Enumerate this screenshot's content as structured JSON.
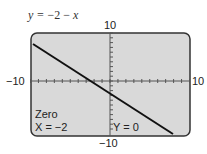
{
  "equation": {
    "prefix": "y = ",
    "rest": "−2 − ",
    "var": "x"
  },
  "window": {
    "xmin_label": "−10",
    "xmax_label": "10",
    "ymin_label": "−10",
    "ymax_label": "10"
  },
  "trace": {
    "mode": "Zero",
    "x_readout": "X = −2",
    "y_readout": "Y = 0"
  },
  "colors": {
    "screen_bg": "#d9d9d9",
    "border": "#333333",
    "line": "#111111"
  },
  "chart_data": {
    "type": "line",
    "title": "y = −2 − x",
    "x": [
      -10,
      -2,
      0,
      8
    ],
    "series": [
      {
        "name": "y = -2 - x",
        "values": [
          8,
          0,
          -2,
          -10
        ]
      }
    ],
    "xlabel": "",
    "ylabel": "",
    "xlim": [
      -10,
      10
    ],
    "ylim": [
      -10,
      10
    ],
    "xscale": 1,
    "yscale": 1,
    "grid": false,
    "annotations": [
      "Zero",
      "X = -2",
      "Y = 0"
    ]
  }
}
